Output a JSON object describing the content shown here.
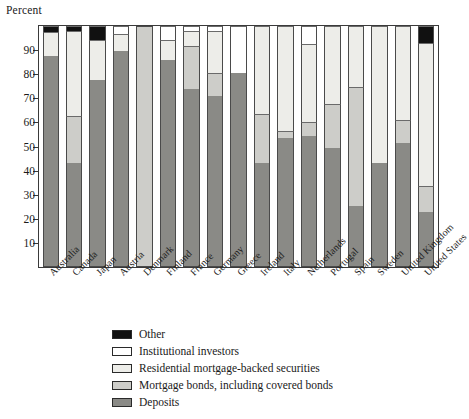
{
  "chart_data": {
    "type": "bar",
    "subtype": "stacked-bar-100-percent",
    "title": "",
    "ylabel": "Percent",
    "xlabel": "",
    "ylim": [
      0,
      100
    ],
    "yticks": [
      10,
      20,
      30,
      40,
      50,
      60,
      70,
      80,
      90
    ],
    "ytick_labels": [
      "10",
      "20",
      "30",
      "40",
      "50",
      "60",
      "70",
      "80",
      "90"
    ],
    "grid": false,
    "legend_position": "below-plot-left",
    "stack_order_bottom_to_top": [
      "Deposits",
      "Mortgage bonds, including covered bonds",
      "Residential mortgage-backed securities",
      "Institutional investors",
      "Other"
    ],
    "categories": [
      "Australia",
      "Canada",
      "Japan",
      "Austria",
      "Denmark",
      "Finland",
      "France",
      "Germany",
      "Greece",
      "Ireland",
      "Italy",
      "Netherlands",
      "Portugal",
      "Spain",
      "Sweden",
      "United Kingdom",
      "United States"
    ],
    "series": [
      {
        "name": "Deposits",
        "color": "#8a8a86",
        "values": [
          87.5,
          43.0,
          77.5,
          89.5,
          0.0,
          86.0,
          74.0,
          71.0,
          80.5,
          43.0,
          53.5,
          54.5,
          49.5,
          25.5,
          43.0,
          51.5,
          23.0
        ]
      },
      {
        "name": "Mortgage bonds, including covered bonds",
        "color": "#cdcdc9",
        "values": [
          0.0,
          19.5,
          0.0,
          0.0,
          100.0,
          0.0,
          17.5,
          9.5,
          0.0,
          20.5,
          3.0,
          5.5,
          18.0,
          49.0,
          0.0,
          9.5,
          10.5
        ]
      },
      {
        "name": "Residential mortgage-backed securities",
        "color": "#edede9",
        "values": [
          10.0,
          35.5,
          16.5,
          7.0,
          0.0,
          8.0,
          6.5,
          17.5,
          0.0,
          36.5,
          43.5,
          32.5,
          32.5,
          25.5,
          57.0,
          39.0,
          59.5
        ]
      },
      {
        "name": "Institutional investors",
        "color": "#ffffff",
        "values": [
          0.0,
          0.0,
          0.0,
          3.5,
          0.0,
          6.0,
          2.0,
          2.0,
          19.5,
          0.0,
          0.0,
          7.5,
          0.0,
          0.0,
          0.0,
          0.0,
          0.0
        ]
      },
      {
        "name": "Other",
        "color": "#111111",
        "values": [
          2.5,
          2.0,
          6.0,
          0.0,
          0.0,
          0.0,
          0.0,
          0.0,
          0.0,
          0.0,
          0.0,
          0.0,
          0.0,
          0.0,
          0.0,
          0.0,
          7.0
        ]
      }
    ]
  },
  "legend": {
    "items": [
      {
        "label": "Other",
        "color": "#111111"
      },
      {
        "label": "Institutional investors",
        "color": "#ffffff"
      },
      {
        "label": "Residential mortgage-backed securities",
        "color": "#edede9"
      },
      {
        "label": "Mortgage bonds, including covered bonds",
        "color": "#cdcdc9"
      },
      {
        "label": "Deposits",
        "color": "#8a8a86"
      }
    ]
  }
}
